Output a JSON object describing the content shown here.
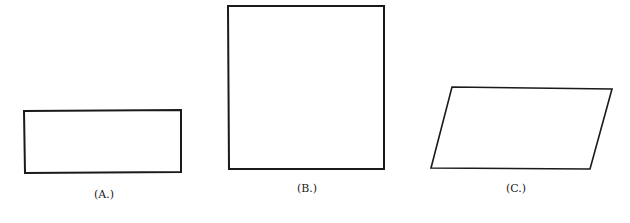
{
  "figure": {
    "stroke_color": "#1a1a1a",
    "background": "#ffffff",
    "shapes": [
      {
        "id": "A",
        "kind": "rectangle (wide, short)",
        "points": "24,111 181,110 181,172 25,173",
        "label": "(A.)",
        "label_x": 104,
        "label_y": 197
      },
      {
        "id": "B",
        "kind": "square (tall)",
        "points": "228,6 384,6 384,169 229,169",
        "label": "(B.)",
        "label_x": 307,
        "label_y": 191
      },
      {
        "id": "C",
        "kind": "parallelogram",
        "points": "452,87 612,89 590,169 431,168",
        "label": "(C.)",
        "label_x": 516,
        "label_y": 191
      }
    ]
  }
}
